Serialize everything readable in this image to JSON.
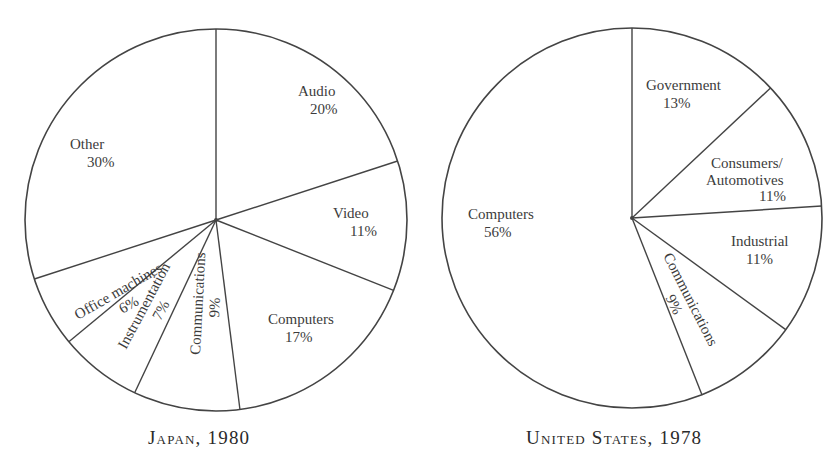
{
  "chart_data": [
    {
      "type": "pie",
      "title": "JAPAN, 1980",
      "start_angle_deg": 0,
      "direction": "clockwise",
      "center": [
        216,
        220
      ],
      "radius": 191,
      "categories": [
        "Audio",
        "Video",
        "Computers",
        "Communications",
        "Instrumentation",
        "Office machines",
        "Other"
      ],
      "values": [
        20,
        11,
        17,
        9,
        7,
        6,
        30
      ],
      "unit": "%",
      "labels": [
        {
          "name": "Audio",
          "pct": "20%",
          "x": 298,
          "y": 96,
          "px": 310,
          "py": 114,
          "rotate": 0
        },
        {
          "name": "Video",
          "pct": "11%",
          "x": 333,
          "y": 218,
          "px": 350,
          "py": 236,
          "rotate": 0
        },
        {
          "name": "Computers",
          "pct": "17%",
          "x": 268,
          "y": 324,
          "px": 285,
          "py": 342,
          "rotate": 0
        },
        {
          "name": "Communications",
          "pct": "9%",
          "x": 200,
          "y": 355,
          "px": 216,
          "py": 357,
          "rotate": -87
        },
        {
          "name": "Instrumentation",
          "pct": "7%",
          "x": 126,
          "y": 350,
          "px": 144,
          "py": 345,
          "rotate": -62
        },
        {
          "name": "Office machines",
          "pct": "6%",
          "x": 78,
          "y": 320,
          "px": 98,
          "py": 308,
          "rotate": -30
        },
        {
          "name": "Other",
          "pct": "30%",
          "x": 70,
          "y": 149,
          "px": 87,
          "py": 167,
          "rotate": 0
        }
      ]
    },
    {
      "type": "pie",
      "title": "UNITED STATES, 1978",
      "start_angle_deg": 0,
      "direction": "clockwise",
      "center": [
        632,
        218
      ],
      "radius": 190,
      "categories": [
        "Government",
        "Consumers/Automotives",
        "Industrial",
        "Communications",
        "Computers"
      ],
      "values": [
        13,
        11,
        11,
        9,
        56
      ],
      "unit": "%",
      "labels": [
        {
          "name": "Government",
          "pct": "13%",
          "x": 646,
          "y": 90,
          "px": 663,
          "py": 108,
          "rotate": 0
        },
        {
          "name": "Consumers/",
          "name2": "Automotives",
          "pct": "11%",
          "x": 711,
          "y": 168,
          "x2": 706,
          "y2": 185,
          "px": 759,
          "py": 201,
          "rotate": 0
        },
        {
          "name": "Industrial",
          "pct": "11%",
          "x": 731,
          "y": 246,
          "px": 746,
          "py": 264,
          "rotate": 0
        },
        {
          "name": "Communications",
          "pct": "9%",
          "x": 663,
          "y": 256,
          "px": 700,
          "py": 278,
          "rotate": 63
        },
        {
          "name": "Computers",
          "pct": "56%",
          "x": 468,
          "y": 219,
          "px": 484,
          "py": 237,
          "rotate": 0
        }
      ]
    }
  ],
  "captions": {
    "japan": "Japan, 1980",
    "us": "United States, 1978"
  },
  "style": {
    "stroke": "#444444",
    "text": "#3c3c3c",
    "background": "#ffffff"
  }
}
